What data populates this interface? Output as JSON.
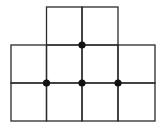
{
  "diagram": {
    "line_color": "#2a2a2a",
    "dot_color": "#111111",
    "grid": {
      "x_lines": [
        11,
        46.5,
        82,
        118,
        155
      ],
      "y_lines": [
        7,
        45,
        83,
        121
      ]
    },
    "cells": [
      {
        "row": 0,
        "col": 1
      },
      {
        "row": 0,
        "col": 2
      },
      {
        "row": 1,
        "col": 0
      },
      {
        "row": 1,
        "col": 1
      },
      {
        "row": 1,
        "col": 2
      },
      {
        "row": 1,
        "col": 3
      },
      {
        "row": 2,
        "col": 0
      },
      {
        "row": 2,
        "col": 1
      },
      {
        "row": 2,
        "col": 2
      },
      {
        "row": 2,
        "col": 3
      }
    ],
    "dots": [
      {
        "xi": 2,
        "yi": 1
      },
      {
        "xi": 1,
        "yi": 2
      },
      {
        "xi": 2,
        "yi": 2
      },
      {
        "xi": 3,
        "yi": 2
      }
    ]
  }
}
